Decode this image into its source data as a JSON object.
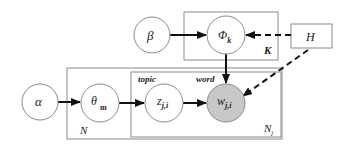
{
  "nodes": {
    "alpha": {
      "label": "α"
    },
    "beta": {
      "label": "β"
    },
    "theta": {
      "label": "θ",
      "sub": "m"
    },
    "phi": {
      "label": "Φ",
      "sub": "k"
    },
    "z": {
      "label": "z",
      "sub": "j,i"
    },
    "w": {
      "label": "w",
      "sub": "j,i"
    },
    "h": {
      "label": "H"
    }
  },
  "plates": {
    "k_plate": {
      "label": "K"
    },
    "n_plate": {
      "label": "N"
    },
    "nj_plate": {
      "label": "N",
      "sub": "j"
    }
  },
  "annotations": {
    "topic": "topic",
    "word": "word"
  },
  "colors": {
    "observed_fill": "#c8c8c8",
    "stroke": "#8a8a8a",
    "arrow": "#111111"
  }
}
